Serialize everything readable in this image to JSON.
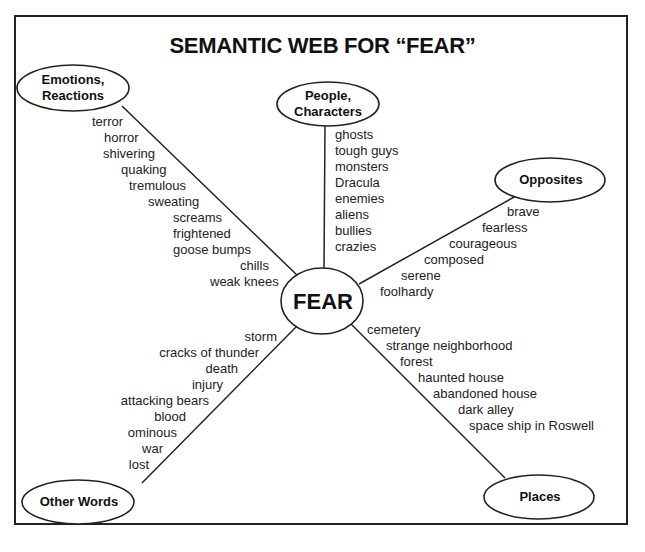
{
  "title": "SEMANTIC WEB FOR “FEAR”",
  "center": {
    "label": "FEAR"
  },
  "categories": {
    "emotions": {
      "label_line1": "Emotions,",
      "label_line2": "Reactions",
      "words": [
        "terror",
        "horror",
        "shivering",
        "quaking",
        "tremulous",
        "sweating",
        "screams",
        "frightened",
        "goose bumps",
        "chills",
        "weak knees"
      ]
    },
    "people": {
      "label_line1": "People,",
      "label_line2": "Characters",
      "words": [
        "ghosts",
        "tough guys",
        "monsters",
        "Dracula",
        "enemies",
        "aliens",
        "bullies",
        "crazies"
      ]
    },
    "opposites": {
      "label": "Opposites",
      "words": [
        "brave",
        "fearless",
        "courageous",
        "composed",
        "serene",
        "foolhardy"
      ]
    },
    "other_words": {
      "label": "Other Words",
      "words": [
        "storm",
        "cracks of thunder",
        "death",
        "injury",
        "attacking bears",
        "blood",
        "ominous",
        "war",
        "lost"
      ]
    },
    "places": {
      "label": "Places",
      "words": [
        "cemetery",
        "strange neighborhood",
        "forest",
        "haunted house",
        "abandoned house",
        "dark alley",
        "space ship in Roswell"
      ]
    }
  }
}
